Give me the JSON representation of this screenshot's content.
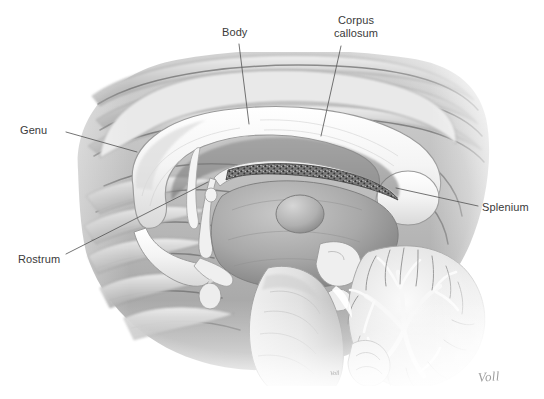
{
  "figure": {
    "style": "grayscale pencil/airbrush medical illustration on white background",
    "artist_signature": "Voll",
    "artist_signature_small": "Voll"
  },
  "labels": [
    {
      "id": "genu",
      "text": "Genu",
      "x": 20,
      "y": 124,
      "align": "left"
    },
    {
      "id": "body",
      "text": "Body",
      "x": 222,
      "y": 26,
      "align": "left"
    },
    {
      "id": "corpus-callosum",
      "text": "Corpus\ncallosum",
      "x": 326,
      "y": 14,
      "align": "center"
    },
    {
      "id": "splenium",
      "text": "Splenium",
      "x": 482,
      "y": 201,
      "align": "left"
    },
    {
      "id": "rostrum",
      "text": "Rostrum",
      "x": 18,
      "y": 253,
      "align": "left"
    }
  ],
  "leaders": [
    {
      "id": "leader-genu",
      "from": [
        66,
        132
      ],
      "to": [
        137,
        152
      ]
    },
    {
      "id": "leader-body",
      "from": [
        239,
        44
      ],
      "to": [
        249,
        124
      ]
    },
    {
      "id": "leader-corpus-callosum",
      "from": [
        341,
        46
      ],
      "to": [
        321,
        136
      ]
    },
    {
      "id": "leader-splenium",
      "from": [
        478,
        206
      ],
      "to": [
        396,
        188
      ]
    },
    {
      "id": "leader-rostrum",
      "from": [
        66,
        254
      ],
      "to": [
        208,
        182
      ]
    }
  ],
  "colors": {
    "background": "#ffffff",
    "label_text": "#3a3a3a",
    "leader_line": "#5a5a5a",
    "signature": "#8d8d8d",
    "tissue_light": "#f2f2f2",
    "tissue_mid": "#b9b9b9",
    "tissue_dark": "#6e6e6e",
    "outline": "#4c4c4c"
  },
  "structures": [
    {
      "id": "cerebral-cortex",
      "name": "cerebral cortex / gyri"
    },
    {
      "id": "cingulate-gyrus",
      "name": "cingulate gyrus"
    },
    {
      "id": "corpus-callosum-band",
      "name": "corpus callosum (genu, body, splenium, rostrum)"
    },
    {
      "id": "lateral-ventricle",
      "name": "lateral ventricle"
    },
    {
      "id": "fornix",
      "name": "fornix"
    },
    {
      "id": "choroid-plexus",
      "name": "choroid plexus"
    },
    {
      "id": "thalamus",
      "name": "thalamus"
    },
    {
      "id": "interthalamic-adhesion",
      "name": "interthalamic adhesion"
    },
    {
      "id": "septum-pellucidum",
      "name": "septum pellucidum"
    },
    {
      "id": "anterior-commissure",
      "name": "anterior commissure"
    },
    {
      "id": "optic-chiasm",
      "name": "optic chiasm"
    },
    {
      "id": "pituitary",
      "name": "pituitary gland"
    },
    {
      "id": "midbrain",
      "name": "midbrain / tectum"
    },
    {
      "id": "pons",
      "name": "pons"
    },
    {
      "id": "medulla",
      "name": "medulla oblongata"
    },
    {
      "id": "cerebellum",
      "name": "cerebellum (arbor vitae)"
    }
  ]
}
